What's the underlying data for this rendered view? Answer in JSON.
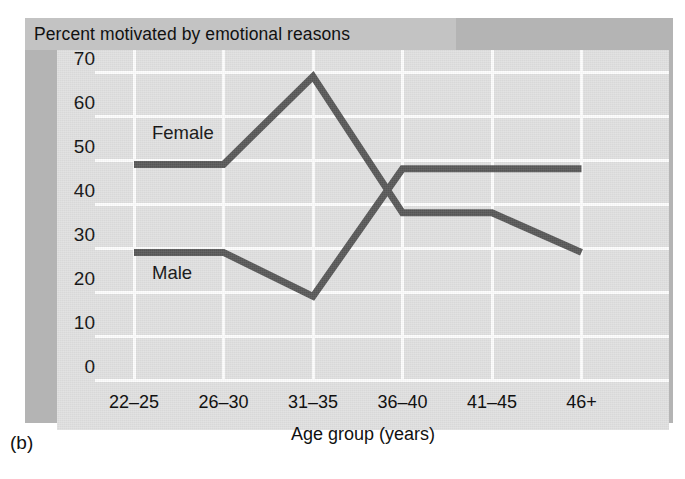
{
  "figure": {
    "caption": "(b)",
    "title": "Percent motivated by emotional reasons"
  },
  "chart_data": {
    "type": "line",
    "title": "Percent motivated by emotional reasons",
    "xlabel": "Age group (years)",
    "ylabel": "",
    "categories": [
      "22–25",
      "26–30",
      "31–35",
      "36–40",
      "41–45",
      "46+"
    ],
    "ylim": [
      0,
      75
    ],
    "yticks": [
      0,
      10,
      20,
      30,
      40,
      50,
      60,
      70
    ],
    "grid": true,
    "legend_position": "inline",
    "series": [
      {
        "name": "Female",
        "label": "Female",
        "color": "#575757",
        "values": [
          49,
          49,
          69,
          38,
          38,
          29
        ]
      },
      {
        "name": "Male",
        "label": "Male",
        "color": "#575757",
        "values": [
          29,
          29,
          19,
          48,
          48,
          48
        ]
      }
    ],
    "annotations": [
      {
        "text": "Female",
        "x_category": "22–25",
        "y_value": 56
      },
      {
        "text": "Male",
        "x_category": "22–25",
        "y_value": 24
      }
    ]
  },
  "colors": {
    "line": "#575757",
    "plot_background": "#e0e0e0",
    "grid": "#fdfdfd",
    "title_band": "#c3c3c3",
    "shadow_band": "#b4b4b4",
    "page_background": "#ffffff"
  }
}
